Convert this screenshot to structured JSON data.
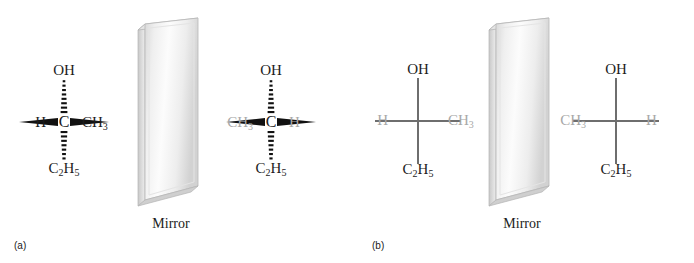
{
  "figure": {
    "background_color": "#ffffff",
    "label_dark_color": "#1c1c1c",
    "label_gray_color": "#a8a8a8",
    "bond_line_color": "#6e6e6e",
    "mirror_label": "Mirror"
  },
  "panels": [
    {
      "caption": "(a)",
      "bond_style": "wedge-hash",
      "mirror_label": "Mirror",
      "molecules": [
        {
          "id": "a-left",
          "side": "left",
          "substituents": {
            "top": "OH",
            "bottom": "C2H5",
            "left": "H",
            "right": "CH3",
            "center": "C"
          },
          "bond_types": {
            "top": "hash",
            "bottom": "hash",
            "left": "wedge",
            "right": "wedge"
          },
          "label_colors": {
            "top": "dark",
            "bottom": "dark",
            "left": "dark",
            "right": "dark",
            "center": "dark"
          }
        },
        {
          "id": "a-right",
          "side": "right",
          "substituents": {
            "top": "OH",
            "bottom": "C2H5",
            "left": "CH3",
            "right": "H",
            "center": "C"
          },
          "bond_types": {
            "top": "hash",
            "bottom": "hash",
            "left": "wedge",
            "right": "wedge"
          },
          "label_colors": {
            "top": "dark",
            "bottom": "dark",
            "left": "gray",
            "right": "gray",
            "center": "dark"
          }
        }
      ]
    },
    {
      "caption": "(b)",
      "bond_style": "plain-line",
      "mirror_label": "Mirror",
      "molecules": [
        {
          "id": "b-left",
          "side": "left",
          "substituents": {
            "top": "OH",
            "bottom": "C2H5",
            "left": "H",
            "right": "CH3",
            "center": ""
          },
          "bond_types": {
            "top": "plain",
            "bottom": "plain",
            "left": "plain",
            "right": "plain"
          },
          "label_colors": {
            "top": "dark",
            "bottom": "dark",
            "left": "gray",
            "right": "gray",
            "center": "dark"
          }
        },
        {
          "id": "b-right",
          "side": "right",
          "substituents": {
            "top": "OH",
            "bottom": "C2H5",
            "left": "CH3",
            "right": "H",
            "center": ""
          },
          "bond_types": {
            "top": "plain",
            "bottom": "plain",
            "left": "plain",
            "right": "plain"
          },
          "label_colors": {
            "top": "dark",
            "bottom": "dark",
            "left": "gray",
            "right": "gray",
            "center": "dark"
          }
        }
      ]
    }
  ],
  "atoms": {
    "oh": "OH",
    "c": "C",
    "h": "H",
    "ch3_main": "CH",
    "ch3_sub": "3",
    "c2h5_c": "C",
    "c2h5_sub1": "2",
    "c2h5_h": "H",
    "c2h5_sub2": "5"
  }
}
